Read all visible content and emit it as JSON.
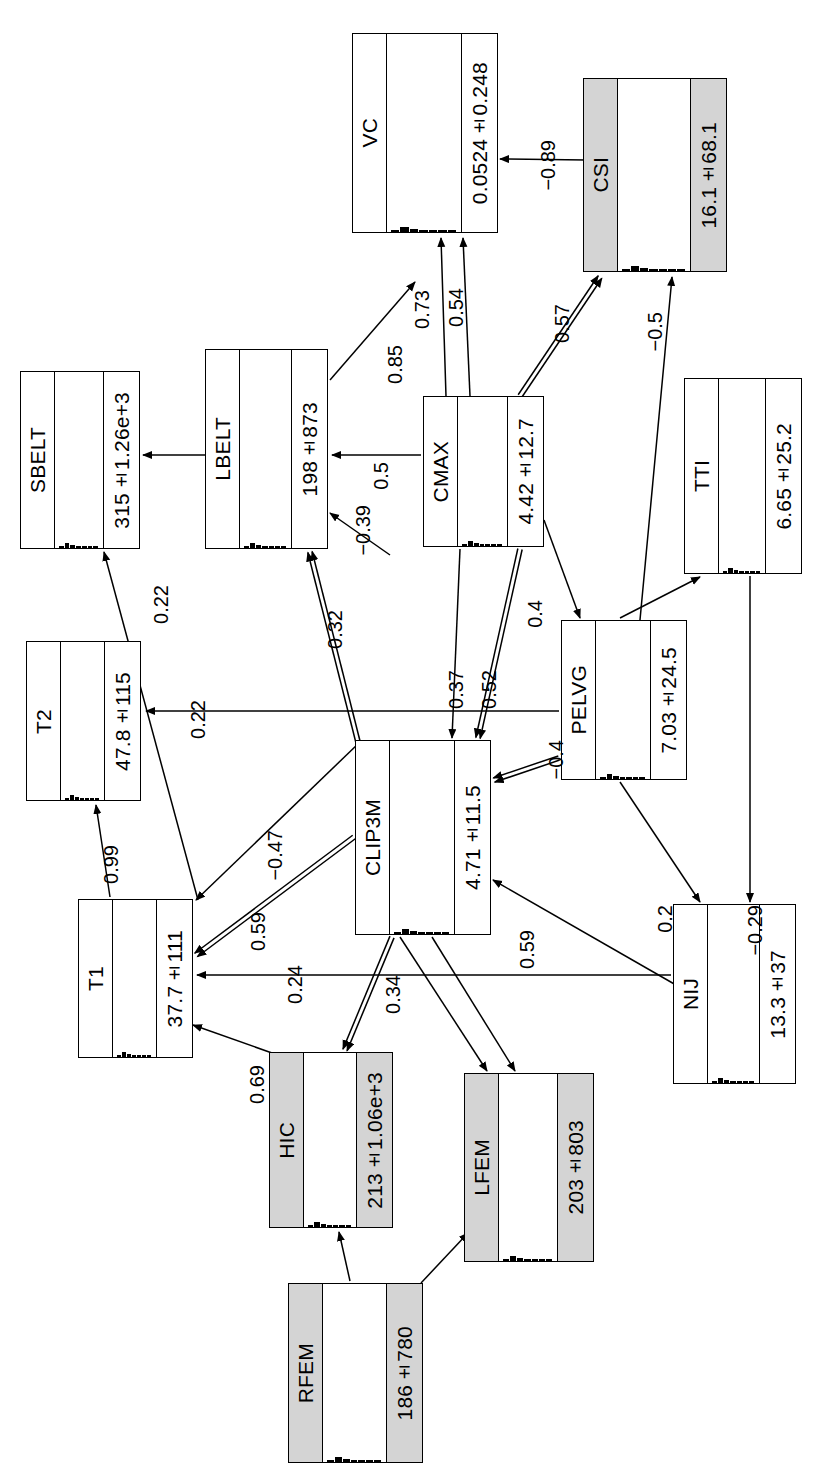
{
  "diagram": {
    "type": "bayesian-network-graph",
    "orientation": "rotated-90-ccw",
    "nodes": [
      {
        "id": "VC",
        "label": "VC",
        "value": "0.0524±0.248",
        "shaded": false,
        "x": 352,
        "y": 33,
        "w": 146,
        "h": 200
      },
      {
        "id": "CSI",
        "label": "CSI",
        "value": "16.1±68.1",
        "shaded": true,
        "x": 583,
        "y": 78,
        "w": 144,
        "h": 194
      },
      {
        "id": "SBELT",
        "label": "SBELT",
        "value": "315±1.26e+3",
        "shaded": false,
        "x": 20,
        "y": 371,
        "w": 120,
        "h": 178
      },
      {
        "id": "LBELT",
        "label": "LBELT",
        "value": "198±873",
        "shaded": false,
        "x": 205,
        "y": 349,
        "w": 123,
        "h": 200
      },
      {
        "id": "CMAX",
        "label": "CMAX",
        "value": "4.42±12.7",
        "shaded": false,
        "x": 423,
        "y": 396,
        "w": 121,
        "h": 151
      },
      {
        "id": "TTI",
        "label": "TTI",
        "value": "6.65±25.2",
        "shaded": false,
        "x": 684,
        "y": 378,
        "w": 118,
        "h": 196
      },
      {
        "id": "T2",
        "label": "T2",
        "value": "47.8±115",
        "shaded": false,
        "x": 26,
        "y": 641,
        "w": 115,
        "h": 160
      },
      {
        "id": "PELVG",
        "label": "PELVG",
        "value": "7.03±24.5",
        "shaded": false,
        "x": 561,
        "y": 620,
        "w": 126,
        "h": 160
      },
      {
        "id": "CLIP3M",
        "label": "CLIP3M",
        "value": "4.71±11.5",
        "shaded": false,
        "x": 355,
        "y": 740,
        "w": 136,
        "h": 195
      },
      {
        "id": "T1",
        "label": "T1",
        "value": "37.7±111",
        "shaded": false,
        "x": 78,
        "y": 899,
        "w": 115,
        "h": 159
      },
      {
        "id": "NIJ",
        "label": "NIJ",
        "value": "13.3±37",
        "shaded": false,
        "x": 673,
        "y": 904,
        "w": 123,
        "h": 180
      },
      {
        "id": "HIC",
        "label": "HIC",
        "value": "213±1.06e+3",
        "shaded": true,
        "x": 269,
        "y": 1052,
        "w": 124,
        "h": 176
      },
      {
        "id": "LFEM",
        "label": "LFEM",
        "value": "203±803",
        "shaded": true,
        "x": 464,
        "y": 1073,
        "w": 130,
        "h": 189
      },
      {
        "id": "RFEM",
        "label": "RFEM",
        "value": "186±780",
        "shaded": true,
        "x": 288,
        "y": 1283,
        "w": 135,
        "h": 180
      }
    ],
    "edges": [
      {
        "from": "CSI",
        "to": "VC",
        "label": "−0.89",
        "double": false,
        "lx": 537,
        "ly": 140,
        "x1": 586,
        "y1": 160,
        "x2": 500,
        "y2": 159
      },
      {
        "from": "CMAX",
        "to": "VC",
        "label": "0.73",
        "double": false,
        "lx": 411,
        "ly": 290,
        "x1": 446,
        "y1": 396,
        "x2": 441,
        "y2": 238
      },
      {
        "from": "CMAX",
        "to": "VC",
        "label": "0.54",
        "double": false,
        "lx": 445,
        "ly": 288,
        "x1": 470,
        "y1": 396,
        "x2": 463,
        "y2": 238
      },
      {
        "from": "LBELT",
        "to": "VC",
        "label": "0.85",
        "double": false,
        "lx": 384,
        "ly": 345,
        "x1": 330,
        "y1": 380,
        "x2": 415,
        "y2": 282
      },
      {
        "from": "CMAX",
        "to": "CSI",
        "label": "0.57",
        "double": true,
        "lx": 551,
        "ly": 304,
        "x1": 520,
        "y1": 396,
        "x2": 600,
        "y2": 277
      },
      {
        "from": "PELVG",
        "to": "CSI",
        "label": "−0.5",
        "double": false,
        "lx": 644,
        "ly": 312,
        "x1": 640,
        "y1": 620,
        "x2": 672,
        "y2": 277
      },
      {
        "from": "LBELT",
        "to": "SBELT",
        "label": "",
        "double": false,
        "lx": 0,
        "ly": 0,
        "x1": 205,
        "y1": 455,
        "x2": 143,
        "y2": 455
      },
      {
        "from": "CMAX",
        "to": "LBELT",
        "label": "0.5",
        "double": false,
        "lx": 370,
        "ly": 462,
        "x1": 421,
        "y1": 455,
        "x2": 332,
        "y2": 455
      },
      {
        "from": "CLIP3M",
        "to": "LBELT",
        "label": "−0.39",
        "double": false,
        "lx": 352,
        "ly": 505,
        "x1": 390,
        "y1": 555,
        "x2": 330,
        "y2": 513
      },
      {
        "from": "CLIP3M",
        "to": "LBELT",
        "label": "0.32",
        "double": true,
        "lx": 324,
        "ly": 610,
        "x1": 358,
        "y1": 742,
        "x2": 310,
        "y2": 552
      },
      {
        "from": "T1",
        "to": "SBELT",
        "label": "0.22",
        "double": false,
        "lx": 150,
        "ly": 585,
        "x1": 198,
        "y1": 900,
        "x2": 104,
        "y2": 552
      },
      {
        "from": "CMAX",
        "to": "CLIP3M",
        "label": "0.37",
        "double": false,
        "lx": 445,
        "ly": 670,
        "x1": 460,
        "y1": 549,
        "x2": 452,
        "y2": 738
      },
      {
        "from": "CMAX",
        "to": "CLIP3M",
        "label": "0.52",
        "double": true,
        "lx": 478,
        "ly": 670,
        "x1": 520,
        "y1": 549,
        "x2": 478,
        "y2": 738
      },
      {
        "from": "CMAX",
        "to": "PELVG",
        "label": "0.4",
        "double": false,
        "lx": 524,
        "ly": 600,
        "x1": 544,
        "y1": 520,
        "x2": 580,
        "y2": 618
      },
      {
        "from": "PELVG",
        "to": "T2",
        "label": "0.22",
        "double": false,
        "lx": 187,
        "ly": 700,
        "x1": 559,
        "y1": 711,
        "x2": 146,
        "y2": 711
      },
      {
        "from": "PELVG",
        "to": "CLIP3M",
        "label": "−0.4",
        "double": true,
        "lx": 545,
        "ly": 740,
        "x1": 559,
        "y1": 758,
        "x2": 494,
        "y2": 780
      },
      {
        "from": "PELVG",
        "to": "TTI",
        "label": "",
        "double": false,
        "lx": 0,
        "ly": 0,
        "x1": 620,
        "y1": 618,
        "x2": 700,
        "y2": 577
      },
      {
        "from": "T1",
        "to": "T2",
        "label": "0.99",
        "double": false,
        "lx": 100,
        "ly": 845,
        "x1": 110,
        "y1": 897,
        "x2": 96,
        "y2": 805
      },
      {
        "from": "CLIP3M",
        "to": "T1",
        "label": "−0.47",
        "double": false,
        "lx": 264,
        "ly": 830,
        "x1": 360,
        "y1": 742,
        "x2": 196,
        "y2": 900
      },
      {
        "from": "CLIP3M",
        "to": "T1",
        "label": "0.59",
        "double": true,
        "lx": 247,
        "ly": 912,
        "x1": 354,
        "y1": 837,
        "x2": 196,
        "y2": 955
      },
      {
        "from": "NIJ",
        "to": "T1",
        "label": "0.24",
        "double": false,
        "lx": 284,
        "ly": 965,
        "x1": 671,
        "y1": 975,
        "x2": 197,
        "y2": 975
      },
      {
        "from": "HIC",
        "to": "T1",
        "label": "0.69",
        "double": false,
        "lx": 246,
        "ly": 1065,
        "x1": 272,
        "y1": 1053,
        "x2": 193,
        "y2": 1025
      },
      {
        "from": "CLIP3M",
        "to": "HIC",
        "label": "0.34",
        "double": true,
        "lx": 382,
        "ly": 975,
        "x1": 392,
        "y1": 937,
        "x2": 345,
        "y2": 1050
      },
      {
        "from": "NIJ",
        "to": "CLIP3M",
        "label": "0.59",
        "double": false,
        "lx": 516,
        "ly": 930,
        "x1": 676,
        "y1": 985,
        "x2": 493,
        "y2": 880
      },
      {
        "from": "PELVG",
        "to": "NIJ",
        "label": "0.2",
        "double": false,
        "lx": 654,
        "ly": 905,
        "x1": 620,
        "y1": 782,
        "x2": 700,
        "y2": 902
      },
      {
        "from": "TTI",
        "to": "NIJ",
        "label": "−0.29",
        "double": false,
        "lx": 744,
        "ly": 905,
        "x1": 750,
        "y1": 576,
        "x2": 750,
        "y2": 902
      },
      {
        "from": "CLIP3M",
        "to": "LFEM",
        "label": "",
        "double": false,
        "lx": 0,
        "ly": 0,
        "x1": 400,
        "y1": 937,
        "x2": 487,
        "y2": 1071
      },
      {
        "from": "CLIP3M",
        "to": "LFEM",
        "label": "",
        "double": false,
        "lx": 0,
        "ly": 0,
        "x1": 432,
        "y1": 937,
        "x2": 515,
        "y2": 1071
      },
      {
        "from": "RFEM",
        "to": "HIC",
        "label": "",
        "double": false,
        "lx": 0,
        "ly": 0,
        "x1": 350,
        "y1": 1281,
        "x2": 339,
        "y2": 1232
      },
      {
        "from": "RFEM",
        "to": "LFEM",
        "label": "",
        "double": false,
        "lx": 0,
        "ly": 0,
        "x1": 421,
        "y1": 1283,
        "x2": 468,
        "y2": 1233
      }
    ]
  }
}
